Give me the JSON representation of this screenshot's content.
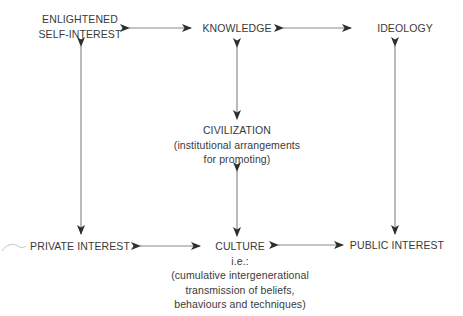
{
  "diagram": {
    "nodes": {
      "enlightened_self_interest": {
        "lines": [
          "ENLIGHTENED",
          "SELF-INTEREST"
        ]
      },
      "knowledge": {
        "title": "KNOWLEDGE"
      },
      "ideology": {
        "title": "IDEOLOGY"
      },
      "civilization": {
        "title": "CIVILIZATION",
        "lines": [
          "(institutional arrangements",
          "for promoting)"
        ]
      },
      "private_interest": {
        "title": "PRIVATE INTEREST"
      },
      "culture": {
        "title": "CULTURE",
        "lines": [
          "i.e.:",
          "(cumulative intergenerational",
          "transmission of beliefs,",
          "behaviours and techniques)"
        ]
      },
      "public_interest": {
        "title": "PUBLIC INTEREST"
      }
    },
    "edges": [
      {
        "from": "enlightened_self_interest",
        "to": "knowledge",
        "type": "bidirectional"
      },
      {
        "from": "knowledge",
        "to": "ideology",
        "type": "bidirectional"
      },
      {
        "from": "enlightened_self_interest",
        "to": "private_interest",
        "type": "bidirectional"
      },
      {
        "from": "knowledge",
        "to": "civilization",
        "type": "bidirectional"
      },
      {
        "from": "civilization",
        "to": "culture",
        "type": "bidirectional"
      },
      {
        "from": "ideology",
        "to": "public_interest",
        "type": "bidirectional"
      },
      {
        "from": "private_interest",
        "to": "culture",
        "type": "bidirectional"
      },
      {
        "from": "culture",
        "to": "public_interest",
        "type": "bidirectional"
      }
    ],
    "colors": {
      "text": "#3a3a3a",
      "line": "#8a8a8a",
      "arrowhead": "#2e2e2e"
    }
  }
}
